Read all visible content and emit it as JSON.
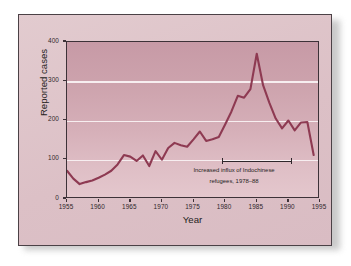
{
  "figure": {
    "axis_title_x": "Year",
    "axis_title_y": "Reported cases",
    "annotation_line1": "Increased influx of Indochinese",
    "annotation_line2": "refugees, 1978–88",
    "accent_line_color": "#8e3a52",
    "grid_color": "#f7eef0",
    "paper_color": "#ddc3c8"
  },
  "chart_data": {
    "type": "line",
    "title": "",
    "xlabel": "Year",
    "ylabel": "Reported cases",
    "xlim": [
      1955,
      1995
    ],
    "ylim": [
      0,
      400
    ],
    "xticks": [
      1955,
      1960,
      1965,
      1970,
      1975,
      1980,
      1985,
      1990,
      1995
    ],
    "yticks": [
      0,
      100,
      200,
      300,
      400
    ],
    "grid": "horizontal",
    "legend": "none",
    "annotations": [
      {
        "text": "Increased influx of Indochinese refugees, 1978–88",
        "span_start": 1978,
        "span_end": 1988,
        "style": "bracket"
      }
    ],
    "x": [
      1955,
      1956,
      1957,
      1958,
      1959,
      1960,
      1961,
      1962,
      1963,
      1964,
      1965,
      1966,
      1967,
      1968,
      1969,
      1970,
      1971,
      1972,
      1973,
      1974,
      1975,
      1976,
      1977,
      1978,
      1979,
      1980,
      1981,
      1982,
      1983,
      1984,
      1985,
      1986,
      1987,
      1988,
      1989,
      1990,
      1991,
      1992,
      1993,
      1994
    ],
    "values": [
      72,
      52,
      38,
      43,
      47,
      54,
      62,
      72,
      88,
      112,
      108,
      97,
      111,
      84,
      122,
      100,
      130,
      143,
      137,
      133,
      152,
      172,
      148,
      152,
      158,
      190,
      223,
      263,
      258,
      280,
      370,
      290,
      245,
      205,
      180,
      200,
      175,
      195,
      196,
      112
    ],
    "series": [
      {
        "name": "Reported cases",
        "color": "#8e3a52",
        "values": [
          72,
          52,
          38,
          43,
          47,
          54,
          62,
          72,
          88,
          112,
          108,
          97,
          111,
          84,
          122,
          100,
          130,
          143,
          137,
          133,
          152,
          172,
          148,
          152,
          158,
          190,
          223,
          263,
          258,
          280,
          370,
          290,
          245,
          205,
          180,
          200,
          175,
          195,
          196,
          112
        ]
      }
    ]
  },
  "axis": {
    "y_tick_labels": [
      "400",
      "300",
      "200",
      "100",
      "0"
    ],
    "x_tick_labels": [
      "1955",
      "1960",
      "1965",
      "1970",
      "1975",
      "1980",
      "1985",
      "1990",
      "1995"
    ]
  }
}
